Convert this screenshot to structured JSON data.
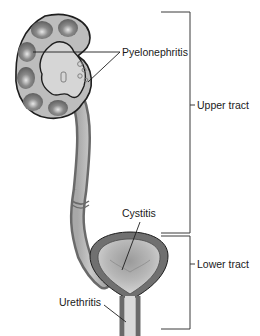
{
  "diagram": {
    "type": "anatomical-illustration",
    "labels": {
      "pyelonephritis": "Pyelonephritis",
      "cystitis": "Cystitis",
      "urethritis": "Urethritis",
      "upper_tract": "Upper tract",
      "lower_tract": "Lower tract"
    },
    "structures": [
      "kidney",
      "ureter",
      "bladder",
      "urethra"
    ],
    "groups": [
      {
        "name": "Upper tract",
        "contains": [
          "kidney",
          "ureter"
        ]
      },
      {
        "name": "Lower tract",
        "contains": [
          "bladder",
          "urethra"
        ]
      }
    ],
    "colors": {
      "outline": "#1e1e1e",
      "tissue_dark": "#6e6e6e",
      "tissue_mid": "#9a9a9a",
      "tissue_light": "#c8c8c8",
      "lumen": "#d9d9d9",
      "bracket": "#3a3a3a"
    }
  }
}
